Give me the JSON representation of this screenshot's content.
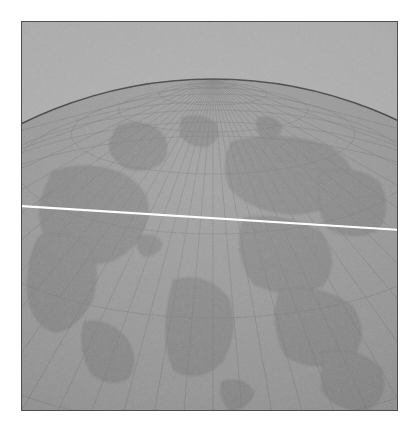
{
  "figure": {
    "type": "globe-illustration",
    "title": "Globe — azimuthal view of the northern hemisphere",
    "medium": "halftone print on paper, grayscale",
    "frame": {
      "border_color": "#4e4e4e",
      "border_width_px": 1,
      "left_px": 21,
      "top_px": 21,
      "width_px": 377,
      "height_px": 390,
      "page_background": "#ffffff"
    },
    "colors": {
      "sky_background": "#a9a9a9",
      "globe_fill": "#8f8f8f",
      "globe_limb": "#3d3d3d",
      "graticule": "#7a7a7a",
      "landmass": "#828282",
      "landmass_edge": "#6f6f6f",
      "highlight_line": "#fdfdfd"
    },
    "globe": {
      "label": "globe-sphere",
      "projection": "orthographic",
      "pole_label": "north-pole",
      "pole_x_px": 212,
      "pole_y_px": 78,
      "center_x_px": 212,
      "center_y_px": 510,
      "radius_px": 432,
      "limb_left_edge_y_px": 158,
      "limb_right_edge_y_px": 155,
      "limb_apex_y_px": 76,
      "meridian_count": 36,
      "meridian_spacing_deg": 10,
      "parallel_count": 8,
      "parallel_spacing_deg": 10,
      "landmasses": [
        "north-america",
        "greenland",
        "eurasia",
        "africa",
        "arctic-islands"
      ]
    },
    "overlay_line": {
      "label": "white-horizon-line",
      "color": "#fdfdfd",
      "thickness_px": 2,
      "start_x_px": 22,
      "start_y_px": 206,
      "end_x_px": 398,
      "end_y_px": 229
    }
  },
  "chart_data": {
    "type": "scatter",
    "title": "Globe — azimuthal view of the northern hemisphere",
    "xlabel": "",
    "ylabel": "",
    "grid": true,
    "legend": "none"
  }
}
